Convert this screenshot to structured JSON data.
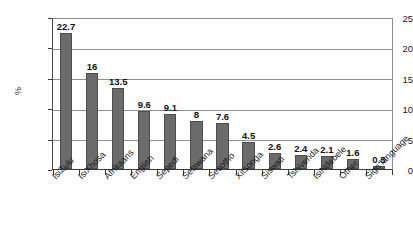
{
  "chart_data": {
    "type": "bar",
    "title": "",
    "subtitle": "",
    "xlabel": "",
    "ylabel": "%",
    "ylim": [
      0,
      25
    ],
    "ytick_step": 5,
    "grid": true,
    "legend": "none",
    "orientation": "vertical",
    "bar_color": "#6b6b6b",
    "categories": [
      "IsiZulu",
      "IsiXhosa",
      "Afrikaans",
      "English",
      "Sepedi",
      "Setswana",
      "Sesotho",
      "Xitsonga",
      "Siswati",
      "Tshivenda",
      "IsiNdebele",
      "Other",
      "Sign language"
    ],
    "values": [
      22.7,
      16,
      13.5,
      9.6,
      9.1,
      8,
      7.6,
      4.5,
      2.6,
      2.4,
      2.1,
      1.6,
      0.5
    ],
    "value_labels": [
      "22.7",
      "16",
      "13.5",
      "9.6",
      "9.1",
      "8",
      "7.6",
      "4.5",
      "2.6",
      "2.4",
      "2.1",
      "1.6",
      "0.5"
    ],
    "ytick_labels": [
      "0",
      "5",
      "10",
      "15",
      "20",
      "25"
    ]
  }
}
